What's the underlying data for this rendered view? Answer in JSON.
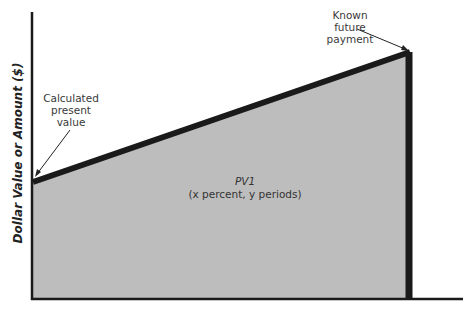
{
  "diagram": {
    "y_axis_label": "Dollar Value or Amount ($)",
    "annotations": {
      "present_value": "Calculated present value",
      "present_value_lines": [
        "Calculated",
        "present",
        "value"
      ],
      "future_payment": "Known future payment",
      "future_payment_lines": [
        "Known",
        "future",
        "payment"
      ]
    },
    "area_label": {
      "title": "PV1",
      "subtitle": "(x percent, y periods)"
    },
    "colors": {
      "fill": "#bdbdbd",
      "line": "#1a1a1a",
      "text": "#3a3a3a"
    }
  }
}
